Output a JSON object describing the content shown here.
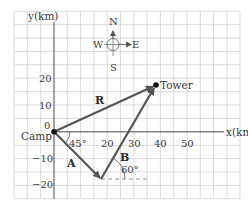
{
  "diagram": {
    "type": "vector-displacement",
    "axes": {
      "x_label": "x(km)",
      "y_label": "y(km)",
      "x_ticks": [
        "20",
        "30",
        "40",
        "50"
      ],
      "y_ticks": [
        "20",
        "10",
        "0",
        "−10",
        "−20"
      ]
    },
    "compass": {
      "north": "N",
      "south": "S",
      "east": "E",
      "west": "W"
    },
    "points": {
      "origin": "Camp",
      "destination": "Tower"
    },
    "vectors": {
      "a": {
        "label": "A",
        "angle": "45°"
      },
      "b": {
        "label": "B",
        "angle": "60°"
      },
      "r": {
        "label": "R"
      }
    },
    "colors": {
      "grid": "#cfcfcf",
      "vector": "#555555",
      "axis": "#4a4a4a",
      "text": "#3a3a3a"
    }
  }
}
